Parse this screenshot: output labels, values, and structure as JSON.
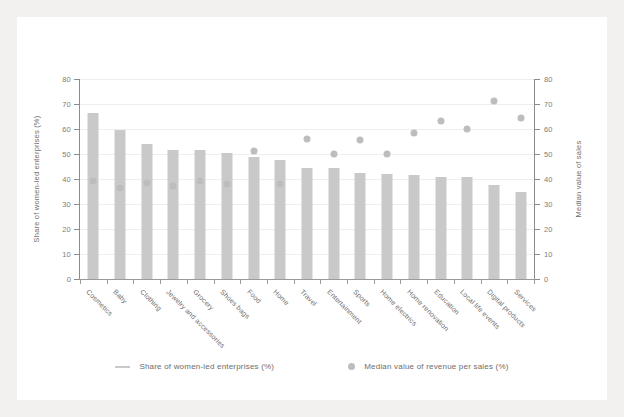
{
  "chart_data": {
    "type": "bar",
    "title": "",
    "xlabel": "",
    "ylabel": "Share of women-led enterprises (%)",
    "y2label": "Median value of sales",
    "ylim": [
      0,
      80
    ],
    "y2lim": [
      0,
      80
    ],
    "yticks": [
      0,
      10,
      20,
      30,
      40,
      50,
      60,
      70,
      80
    ],
    "y2ticks": [
      0,
      10,
      20,
      30,
      40,
      50,
      60,
      70,
      80
    ],
    "grid": true,
    "legend_position": "bottom",
    "categories": [
      "Cosmetics",
      "Baby",
      "Clothing",
      "Jewelry and accessories",
      "Grocery",
      "Shoes bags",
      "Food",
      "Home",
      "Travel",
      "Entertainment",
      "Sports",
      "Home electrics",
      "Home renovation",
      "Education",
      "Local life events",
      "Digital products",
      "Services"
    ],
    "series": [
      {
        "name": "Share of women-led enterprises (%)",
        "type": "bar",
        "color": "#c9c9c9",
        "axis": "left",
        "values": [
          66.5,
          59.5,
          54,
          51.5,
          51.5,
          50.5,
          49,
          47.5,
          44.5,
          44.5,
          42.5,
          42,
          41.5,
          41,
          41,
          37.5,
          35
        ]
      },
      {
        "name": "Median value of revenue per sales (%)",
        "type": "scatter",
        "color": "#bdbdbd",
        "axis": "right",
        "values": [
          40.5,
          38,
          40,
          38.5,
          40.5,
          39.5,
          52.5,
          39.5,
          57.5,
          51.5,
          57,
          51.5,
          60,
          64.5,
          61.5,
          72.5,
          66
        ]
      }
    ],
    "legend": [
      {
        "label": "Share of women-led enterprises (%)",
        "marker": "line",
        "color": "#c9c9c9"
      },
      {
        "label": "Median value of revenue per sales (%)",
        "marker": "dot",
        "color": "#bdbdbd"
      }
    ]
  },
  "colors": {
    "page_background": "#f3f1ef",
    "card_background": "#ffffff",
    "bar": "#c9c9c9",
    "dot": "#bdbdbd",
    "axis": "#8c8c8c",
    "text": "#6d6d6d",
    "grid": "#f0eeec"
  }
}
